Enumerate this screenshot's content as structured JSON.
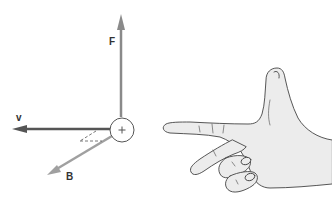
{
  "diagram": {
    "vectors": [
      {
        "id": "F",
        "label": "F",
        "meaning": "force",
        "direction": "up",
        "color": "#8a8a8a"
      },
      {
        "id": "v",
        "label": "v",
        "meaning": "velocity",
        "direction": "left",
        "color": "#555555"
      },
      {
        "id": "B",
        "label": "B",
        "meaning": "magnetic field",
        "direction": "down-left",
        "color": "#a0a0a0"
      }
    ],
    "charge": {
      "symbol": "+",
      "description": "positive charge"
    },
    "hand": {
      "description": "right hand: index finger pointing left, thumb pointing up, middle finger pointing down-left",
      "fill": "#ececec",
      "stroke": "#444444"
    }
  }
}
